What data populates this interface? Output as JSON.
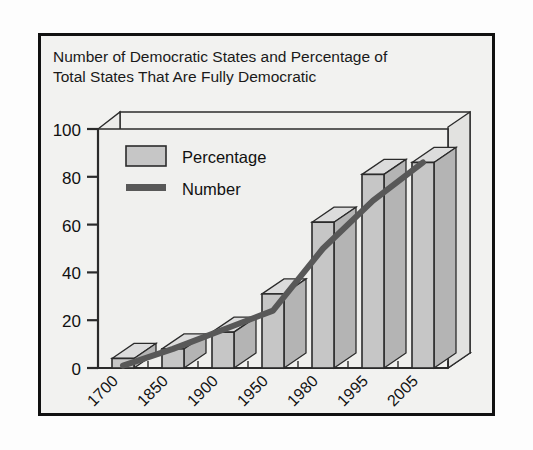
{
  "figure": {
    "border_color": "#111111",
    "panel_bg": "#f2f2f0",
    "plot_bg": "#f0f0ee"
  },
  "chart_data": {
    "type": "bar",
    "title": "Number of Democratic States and Percentage of Total States That Are Fully Democratic",
    "title_line1": "Number of Democratic States and Percentage of",
    "title_line2": "Total States That Are Fully Democratic",
    "xlabel": "",
    "ylabel": "",
    "ylim": [
      0,
      100
    ],
    "yticks": [
      0,
      20,
      40,
      60,
      80,
      100
    ],
    "grid": false,
    "legend_position": "top-left-inside",
    "categories": [
      "1700",
      "1850",
      "1900",
      "1950",
      "1980",
      "1995",
      "2005"
    ],
    "series": [
      {
        "name": "Percentage",
        "type": "bar",
        "color": "#c6c6c6",
        "edge_color": "#2b2b2b",
        "values": [
          4,
          8,
          15,
          31,
          61,
          81,
          86
        ]
      },
      {
        "name": "Number",
        "type": "line",
        "color": "#585858",
        "values": [
          1,
          8,
          16,
          24,
          50,
          70,
          86
        ]
      }
    ],
    "legend": [
      {
        "label": "Percentage",
        "marker": "swatch",
        "color": "#c6c6c6"
      },
      {
        "label": "Number",
        "marker": "line",
        "color": "#585858"
      }
    ]
  }
}
